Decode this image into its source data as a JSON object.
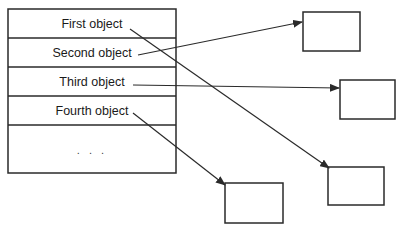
{
  "diagram": {
    "table": {
      "x": 8,
      "y": 9,
      "width": 168,
      "row_lines_y": [
        9,
        38,
        67,
        96,
        125,
        173
      ],
      "rows": [
        {
          "label": "First object",
          "text_y": 17
        },
        {
          "label": "Second object",
          "text_y": 46
        },
        {
          "label": "Third object",
          "text_y": 75
        },
        {
          "label": "Fourth object",
          "text_y": 104
        },
        {
          "label": ". . .",
          "text_y": 143
        }
      ]
    },
    "target_boxes": [
      {
        "name": "object-box-1",
        "x": 303,
        "y": 12,
        "w": 57,
        "h": 39
      },
      {
        "name": "object-box-2",
        "x": 340,
        "y": 80,
        "w": 55,
        "h": 39
      },
      {
        "name": "object-box-3",
        "x": 328,
        "y": 167,
        "w": 56,
        "h": 38
      },
      {
        "name": "object-box-4",
        "x": 225,
        "y": 183,
        "w": 58,
        "h": 40
      }
    ],
    "arrows": [
      {
        "from": "First object",
        "to": "object-box-3",
        "x1": 130,
        "y1": 29,
        "x2": 329,
        "y2": 168
      },
      {
        "from": "Second object",
        "to": "object-box-1",
        "x1": 138,
        "y1": 55,
        "x2": 302,
        "y2": 22
      },
      {
        "from": "Third object",
        "to": "object-box-2",
        "x1": 133,
        "y1": 85,
        "x2": 339,
        "y2": 88
      },
      {
        "from": "Fourth object",
        "to": "object-box-4",
        "x1": 133,
        "y1": 113,
        "x2": 225,
        "y2": 185
      }
    ],
    "colors": {
      "stroke": "#2a2a2a",
      "text": "#1a1a1a",
      "background": "#ffffff"
    }
  }
}
